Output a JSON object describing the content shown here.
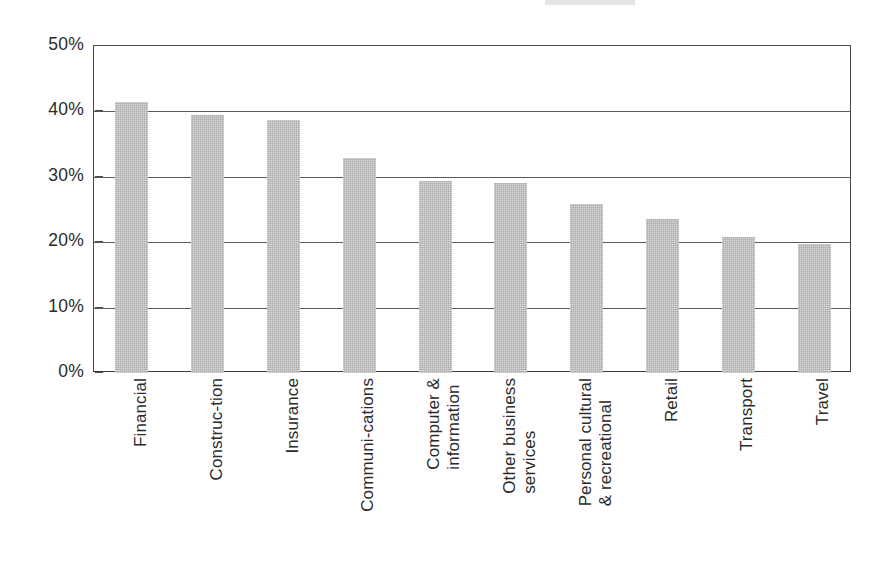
{
  "chart_data": {
    "type": "bar",
    "title": "",
    "subtitle": "",
    "xlabel": "",
    "ylabel": "",
    "ylim": [
      0,
      50
    ],
    "y_tick_labels": [
      "50%",
      "40%",
      "30%",
      "20%",
      "10%",
      "0%"
    ],
    "y_tick_values": [
      50,
      40,
      30,
      20,
      10,
      0
    ],
    "grid": true,
    "gridlines_at": [
      50,
      40,
      30,
      20,
      10
    ],
    "legend": false,
    "legend_position": "none",
    "units": "percent",
    "bar_color": "#bdbdbd",
    "axis_color": "#4a4a4a",
    "categories": [
      "Financial",
      "Construc-tion",
      "Insurance",
      "Communi-cations",
      "Computer & information",
      "Other business services",
      "Personal cultural & recreational",
      "Retail",
      "Transport",
      "Travel"
    ],
    "category_lines": [
      [
        "Financial"
      ],
      [
        "Construc-tion"
      ],
      [
        "Insurance"
      ],
      [
        "Communi-cations"
      ],
      [
        "Computer &",
        "information"
      ],
      [
        "Other business",
        "services"
      ],
      [
        "Personal cultural",
        "& recreational"
      ],
      [
        "Retail"
      ],
      [
        "Transport"
      ],
      [
        "Travel"
      ]
    ],
    "values": [
      41.5,
      39.4,
      38.7,
      32.8,
      29.3,
      29.0,
      25.9,
      23.5,
      20.8,
      19.7
    ],
    "series": [
      {
        "name": "",
        "values": [
          41.5,
          39.4,
          38.7,
          32.8,
          29.3,
          29.0,
          25.9,
          23.5,
          20.8,
          19.7
        ]
      }
    ]
  }
}
